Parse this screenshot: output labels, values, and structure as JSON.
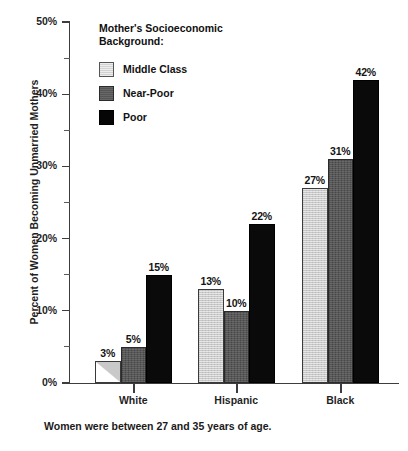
{
  "chart_data": {
    "type": "bar",
    "title": "",
    "subtitle": "",
    "xlabel": "",
    "ylabel": "Percent of Women Becoming Unmarried Mothers",
    "ylim": [
      0,
      50
    ],
    "y_ticks": [
      "0%",
      "10%",
      "20%",
      "30%",
      "40%",
      "50%"
    ],
    "y_tick_values": [
      0,
      10,
      20,
      30,
      40,
      50
    ],
    "y_minor_tick_values": [
      5,
      15,
      25,
      35,
      45
    ],
    "grid": false,
    "legend_position": "inside-top-left",
    "categories": [
      "White",
      "Hispanic",
      "Black"
    ],
    "series": [
      {
        "name": "Middle Class",
        "values": [
          3,
          13,
          27
        ],
        "labels": [
          "3%",
          "13%",
          "27%"
        ],
        "color": "#c9c9c9"
      },
      {
        "name": "Near-Poor",
        "values": [
          5,
          10,
          31
        ],
        "labels": [
          "5%",
          "10%",
          "31%"
        ],
        "color": "#575757"
      },
      {
        "name": "Poor",
        "values": [
          15,
          22,
          42
        ],
        "labels": [
          "15%",
          "22%",
          "42%"
        ],
        "color": "#0a0a0a"
      }
    ],
    "annotations": [
      "Women were between 27 and 35 years of age."
    ]
  },
  "legend": {
    "title": "Mother's Socioeconomic\nBackground:",
    "items": [
      {
        "label": "Middle Class",
        "swatch": "middle"
      },
      {
        "label": "Near-Poor",
        "swatch": "nearpoor"
      },
      {
        "label": "Poor",
        "swatch": "poor"
      }
    ]
  },
  "axis": {
    "y_title": "Percent of Women Becoming Unmarried Mothers",
    "ticks": [
      {
        "label": "50%"
      },
      {
        "label": "40%"
      },
      {
        "label": "30%"
      },
      {
        "label": "20%"
      },
      {
        "label": "10%"
      },
      {
        "label": "0%"
      }
    ]
  },
  "categories": [
    {
      "label": "White"
    },
    {
      "label": "Hispanic"
    },
    {
      "label": "Black"
    }
  ],
  "bars": [
    {
      "value": "3%",
      "group": "White",
      "series": "Middle Class"
    },
    {
      "value": "5%",
      "group": "White",
      "series": "Near-Poor"
    },
    {
      "value": "15%",
      "group": "White",
      "series": "Poor"
    },
    {
      "value": "13%",
      "group": "Hispanic",
      "series": "Middle Class"
    },
    {
      "value": "10%",
      "group": "Hispanic",
      "series": "Near-Poor"
    },
    {
      "value": "22%",
      "group": "Hispanic",
      "series": "Poor"
    },
    {
      "value": "27%",
      "group": "Black",
      "series": "Middle Class"
    },
    {
      "value": "31%",
      "group": "Black",
      "series": "Near-Poor"
    },
    {
      "value": "42%",
      "group": "Black",
      "series": "Poor"
    }
  ],
  "caption": "Women were between 27 and 35 years of age."
}
